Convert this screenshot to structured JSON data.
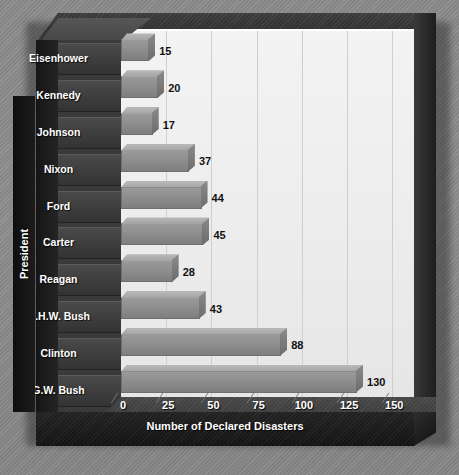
{
  "chart_data": {
    "type": "bar",
    "orientation": "horizontal",
    "title": "",
    "xlabel": "Number of Declared Disasters",
    "ylabel": "President",
    "categories": [
      "Eisenhower",
      "Kennedy",
      "Johnson",
      "Nixon",
      "Ford",
      "Carter",
      "Reagan",
      "G.H.W. Bush",
      "Clinton",
      "G.W. Bush"
    ],
    "values": [
      15,
      20,
      17,
      37,
      44,
      45,
      28,
      43,
      88,
      130
    ],
    "xticks": [
      "0",
      "25",
      "50",
      "75",
      "100",
      "125",
      "150"
    ],
    "xtick_values": [
      0,
      25,
      50,
      75,
      100,
      125,
      150
    ],
    "xlim": [
      0,
      162
    ],
    "grid": "vertical",
    "legend": "none",
    "style": "3d-bar",
    "colors": {
      "background": "#8e8e8e",
      "plot_wall": "#eeeeee",
      "bar_face": "#8e8e8e",
      "bar_top": "#b9b9b9",
      "frame": "#2b2b2b",
      "label_plate": "#3d3d3d",
      "label_text": "#ffffff",
      "value_text": "#111111",
      "gridline": "#cfcfcf"
    }
  },
  "axis": {
    "y_title": "President",
    "x_title": "Number of Declared Disasters"
  },
  "title_sliver": ""
}
